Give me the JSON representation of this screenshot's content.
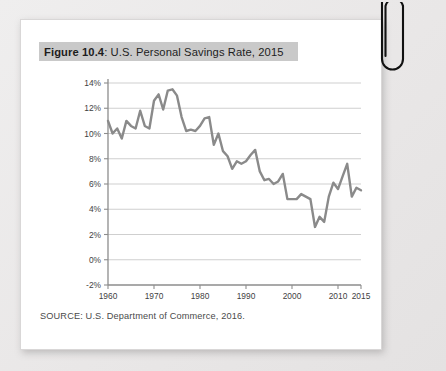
{
  "page": {
    "background_color": "#eceaea",
    "card_background": "#ffffff"
  },
  "figure": {
    "title_prefix": "Figure 10.4",
    "title_separator": ": ",
    "title_rest": "U.S. Personal Savings Rate, 2015",
    "title_full": "Figure 10.4: U.S. Personal Savings Rate, 2015",
    "title_band_color": "#c9c9c9",
    "source": "SOURCE: U.S. Department of Commerce, 2016."
  },
  "decor": {
    "paperclip_label": "paperclip",
    "paperclip_color": "#111111"
  },
  "chart_data": {
    "type": "line",
    "title": "Figure 10.4: U.S. Personal Savings Rate, 2015",
    "xlabel": "",
    "ylabel": "",
    "xlim": [
      1960,
      2015
    ],
    "ylim": [
      -2,
      14
    ],
    "grid": true,
    "legend": false,
    "line_color": "#8a8a8a",
    "y_ticks": [
      -2,
      0,
      2,
      4,
      6,
      8,
      10,
      12,
      14
    ],
    "y_tick_labels": [
      "-2%",
      "0%",
      "2%",
      "4%",
      "6%",
      "8%",
      "10%",
      "12%",
      "14%"
    ],
    "x_ticks": [
      1960,
      1970,
      1980,
      1990,
      2000,
      2010,
      2015
    ],
    "x_tick_labels": [
      "1960",
      "1970",
      "1980",
      "1990",
      "2000",
      "2010",
      "2015"
    ],
    "series": [
      {
        "name": "U.S. Personal Savings Rate",
        "x": [
          1960,
          1961,
          1962,
          1963,
          1964,
          1965,
          1966,
          1967,
          1968,
          1969,
          1970,
          1971,
          1972,
          1973,
          1974,
          1975,
          1976,
          1977,
          1978,
          1979,
          1980,
          1981,
          1982,
          1983,
          1984,
          1985,
          1986,
          1987,
          1988,
          1989,
          1990,
          1991,
          1992,
          1993,
          1994,
          1995,
          1996,
          1997,
          1998,
          1999,
          2000,
          2001,
          2002,
          2003,
          2004,
          2005,
          2006,
          2007,
          2008,
          2009,
          2010,
          2011,
          2012,
          2013,
          2014,
          2015
        ],
        "values": [
          11.0,
          10.0,
          10.4,
          9.6,
          11.0,
          10.6,
          10.4,
          11.8,
          10.6,
          10.4,
          12.6,
          13.1,
          11.9,
          13.4,
          13.5,
          13.0,
          11.3,
          10.2,
          10.3,
          10.2,
          10.6,
          11.2,
          11.3,
          9.1,
          10.0,
          8.6,
          8.2,
          7.2,
          7.8,
          7.6,
          7.8,
          8.3,
          8.7,
          7.0,
          6.3,
          6.4,
          6.0,
          6.2,
          6.8,
          4.8,
          4.8,
          4.8,
          5.2,
          5.0,
          4.8,
          2.6,
          3.4,
          3.0,
          5.0,
          6.1,
          5.6,
          6.6,
          7.6,
          5.0,
          5.7,
          5.5
        ]
      }
    ]
  }
}
